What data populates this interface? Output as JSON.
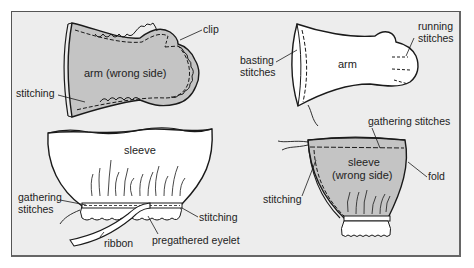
{
  "diagram": {
    "panels": [
      {
        "id": "arm-wrong-side",
        "center_label": "arm (wrong side)",
        "callouts": [
          "clip",
          "stitching"
        ]
      },
      {
        "id": "arm",
        "center_label": "arm",
        "callouts": [
          "basting stitches",
          "running stitches"
        ]
      },
      {
        "id": "sleeve",
        "center_label": "sleeve",
        "callouts": [
          "gathering stitches",
          "stitching",
          "ribbon",
          "pregathered eyelet"
        ]
      },
      {
        "id": "sleeve-wrong-side",
        "center_label": "sleeve (wrong side)",
        "callouts": [
          "gathering stitches",
          "stitching",
          "fold"
        ]
      }
    ],
    "labels": {
      "clip": "clip",
      "arm_wrong_side": "arm (wrong side)",
      "stitching_tl": "stitching",
      "basting_1": "basting",
      "basting_2": "stitches",
      "arm": "arm",
      "running_1": "running",
      "running_2": "stitches",
      "sleeve": "sleeve",
      "gathering_bl_1": "gathering",
      "gathering_bl_2": "stitches",
      "stitching_bl": "stitching",
      "ribbon": "ribbon",
      "pregathered_eyelet": "pregathered eyelet",
      "gathering_br": "gathering stitches",
      "sleeve_ws_1": "sleeve",
      "sleeve_ws_2": "(wrong side)",
      "fold": "fold",
      "stitching_br": "stitching"
    },
    "colors": {
      "background": "#ededed",
      "fabric_wrong_side": "#c4c4c4",
      "fabric_right_side": "#ffffff",
      "ink": "#1a1a1a"
    }
  }
}
